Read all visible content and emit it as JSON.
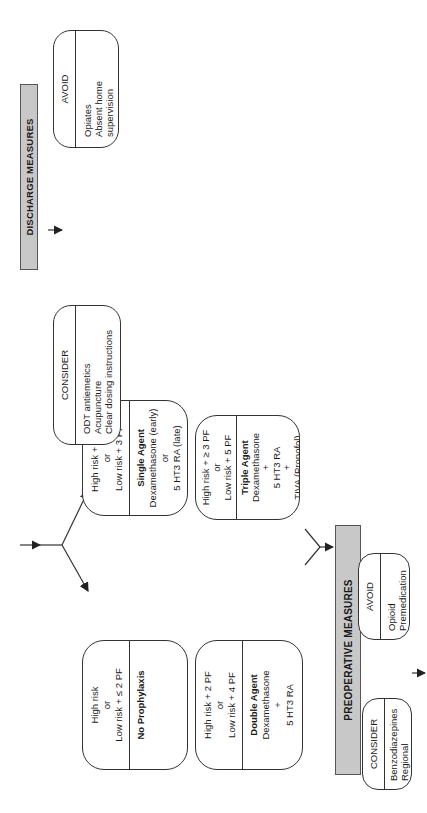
{
  "diagram": {
    "strata": {
      "no_prophylaxis": {
        "criteria": [
          "High risk",
          "or",
          "Low risk + ≤ 2 PF"
        ],
        "title": "No Prophylaxis",
        "items": []
      },
      "single_agent": {
        "criteria": [
          "High risk + 1 PF",
          "or",
          "Low risk + 3 PF"
        ],
        "title": "Single Agent",
        "items": [
          "Dexamethasone (early)",
          "or",
          "5 HT3 RA (late)"
        ]
      },
      "double_agent": {
        "criteria": [
          "High risk + 2 PF",
          "or",
          "Low risk + 4 PF"
        ],
        "title": "Double Agent",
        "items": [
          "Dexamethasone",
          "+",
          "5 HT3 RA"
        ]
      },
      "triple_agent": {
        "criteria": [
          "High risk + ≥ 3 PF",
          "or",
          "Low risk + 5 PF"
        ],
        "title": "Triple Agent",
        "items": [
          "Dexamethasone",
          "+",
          "5 HT3 RA",
          "+",
          "TIVA (Propofol)"
        ]
      }
    },
    "preoperative": {
      "title": "PREOPERATIVE MEASURES",
      "consider": {
        "header": "CONSIDER",
        "items": [
          "Benzodiazepines",
          "Regional Anesthesia"
        ]
      },
      "avoid": {
        "header": "AVOID",
        "items": [
          "Opioid Premedication"
        ]
      }
    },
    "discharge": {
      "title": "DISCHARGE MEASURES",
      "consider": {
        "header": "CONSIDER",
        "items": [
          "ODT antiemetics",
          "Acupuncture",
          "Clear dosing instructions"
        ]
      },
      "avoid": {
        "header": "AVOID",
        "items": [
          "Opiates",
          "Absent home supervision"
        ]
      }
    },
    "colors": {
      "bar_fill": "#c8c8c8",
      "line": "#333333",
      "background": "#ffffff"
    }
  }
}
